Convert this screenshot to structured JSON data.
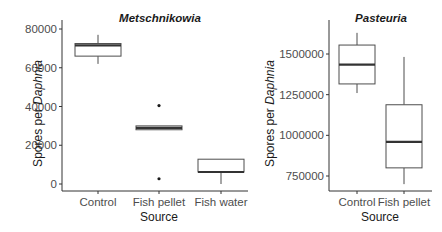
{
  "figure": {
    "x_title": "Source",
    "y_title_prefix": "Spores per ",
    "y_title_italic": "Daphnia"
  },
  "chart_data": [
    {
      "type": "box",
      "title": "Metschnikowia",
      "xlabel": "Source",
      "ylabel": "Spores per Daphnia",
      "categories": [
        "Control",
        "Fish pellet",
        "Fish water"
      ],
      "yticks": [
        0,
        20000,
        40000,
        60000,
        80000
      ],
      "ytick_labels": [
        "0",
        "20000",
        "40000",
        "60000",
        "80000"
      ],
      "ylim": [
        -3500,
        83000
      ],
      "grid": false,
      "boxes": [
        {
          "category": "Control",
          "whisker_low": 62000,
          "q1": 66000,
          "median": 71500,
          "q3": 72500,
          "whisker_high": 77000,
          "outliers": []
        },
        {
          "category": "Fish pellet",
          "whisker_low": 28000,
          "q1": 28000,
          "median": 29000,
          "q3": 30000,
          "whisker_high": 30000,
          "outliers": [
            40500,
            2700
          ]
        },
        {
          "category": "Fish water",
          "whisker_low": 0,
          "q1": 6200,
          "median": 6200,
          "q3": 12800,
          "whisker_high": 12800,
          "outliers": []
        }
      ]
    },
    {
      "type": "box",
      "title": "Pasteuria",
      "xlabel": "Source",
      "ylabel": "Spores per Daphnia",
      "categories": [
        "Control",
        "Fish pellet"
      ],
      "yticks": [
        750000,
        1000000,
        1250000,
        1500000
      ],
      "ytick_labels": [
        "750000",
        "1000000",
        "1250000",
        "1500000"
      ],
      "ylim": [
        660000,
        1680000
      ],
      "grid": false,
      "boxes": [
        {
          "category": "Control",
          "whisker_low": 1260000,
          "q1": 1316000,
          "median": 1435000,
          "q3": 1555000,
          "whisker_high": 1630000,
          "outliers": []
        },
        {
          "category": "Fish pellet",
          "whisker_low": 700000,
          "q1": 800000,
          "median": 960000,
          "q3": 1188000,
          "whisker_high": 1482000,
          "outliers": []
        }
      ]
    }
  ],
  "layout": {
    "panels": [
      {
        "plot_left": 62,
        "plot_right": 248,
        "plot_top": 20,
        "plot_bottom": 191,
        "y0_px": 184,
        "y1_px": 29,
        "y0_val": 0,
        "y1_val": 80000,
        "x_centers": [
          98,
          159,
          221
        ],
        "box_half_width": 23,
        "title_x": 160,
        "title_y": 22,
        "ytitle_x": 42,
        "xtitle_x": 159
      },
      {
        "plot_left": 329,
        "plot_right": 432,
        "plot_top": 20,
        "plot_bottom": 191,
        "y0_px": 176,
        "y1_px": 54,
        "y0_val": 750000,
        "y1_val": 1500000,
        "x_centers": [
          357,
          404
        ],
        "box_half_width": 18,
        "title_x": 381,
        "title_y": 22,
        "ytitle_x": 274,
        "xtitle_x": 380
      }
    ]
  }
}
